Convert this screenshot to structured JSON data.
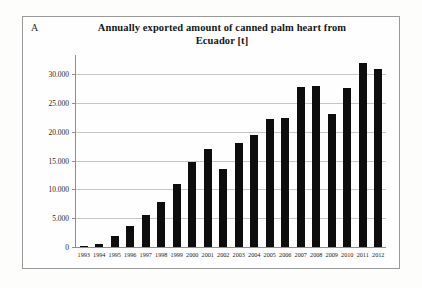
{
  "figure": {
    "panel_label": "A"
  },
  "chart_data": {
    "type": "bar",
    "title": "Annually exported amount of canned palm heart from Ecuador [t]",
    "title_line1": "Annually exported amount of canned palm heart from",
    "title_line2": "Ecuador [t]",
    "xlabel": "",
    "ylabel": "",
    "ylim": [
      0,
      32500
    ],
    "grid": true,
    "legend": false,
    "categories": [
      "1993",
      "1994",
      "1995",
      "1996",
      "1997",
      "1998",
      "1999",
      "2000",
      "2001",
      "2002",
      "2003",
      "2004",
      "2005",
      "2006",
      "2007",
      "2008",
      "2009",
      "2010",
      "2011",
      "2012"
    ],
    "values": [
      200,
      500,
      2000,
      3600,
      5600,
      7800,
      11000,
      14800,
      17000,
      13500,
      18000,
      19500,
      22200,
      22500,
      27800,
      27900,
      23200,
      27700,
      32000,
      31000
    ],
    "ytick_labels": [
      "0",
      "5.000",
      "10.000",
      "15.000",
      "20.000",
      "25.000",
      "30.000"
    ],
    "ytick_values": [
      0,
      5000,
      10000,
      15000,
      20000,
      25000,
      30000
    ],
    "bar_color": "#0d0d0d",
    "grid_color": "#c6c6c6",
    "axis_color": "#8f8f8f"
  }
}
